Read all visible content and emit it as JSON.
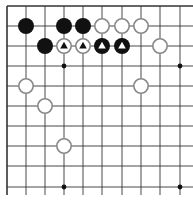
{
  "board": {
    "type": "go-diagram-corner",
    "grid": {
      "x_lines": [
        7,
        26,
        45,
        64,
        83,
        102,
        122,
        141,
        160,
        180
      ],
      "y_lines": [
        6,
        26,
        46,
        66,
        86,
        106,
        126,
        146,
        166,
        187
      ],
      "x_extent": [
        7,
        193
      ],
      "y_extent": [
        6,
        195
      ],
      "line_color": "#333333",
      "edge_top": true,
      "edge_left": true
    },
    "star_points": [
      {
        "col": 3,
        "row": 3
      },
      {
        "col": 9,
        "row": 3
      },
      {
        "col": 3,
        "row": 9
      },
      {
        "col": 9,
        "row": 9
      }
    ],
    "stones": [
      {
        "col": 1,
        "row": 1,
        "color": "black",
        "mark": ""
      },
      {
        "col": 3,
        "row": 1,
        "color": "black",
        "mark": ""
      },
      {
        "col": 4,
        "row": 1,
        "color": "black",
        "mark": ""
      },
      {
        "col": 5,
        "row": 1,
        "color": "white",
        "mark": ""
      },
      {
        "col": 6,
        "row": 1,
        "color": "white",
        "mark": ""
      },
      {
        "col": 7,
        "row": 1,
        "color": "white",
        "mark": ""
      },
      {
        "col": 2,
        "row": 2,
        "color": "black",
        "mark": ""
      },
      {
        "col": 3,
        "row": 2,
        "color": "white",
        "mark": "triangle"
      },
      {
        "col": 4,
        "row": 2,
        "color": "white",
        "mark": "triangle"
      },
      {
        "col": 5,
        "row": 2,
        "color": "black",
        "mark": "triangle"
      },
      {
        "col": 6,
        "row": 2,
        "color": "black",
        "mark": "triangle"
      },
      {
        "col": 8,
        "row": 2,
        "color": "white",
        "mark": ""
      },
      {
        "col": 1,
        "row": 4,
        "color": "white",
        "mark": ""
      },
      {
        "col": 7,
        "row": 4,
        "color": "white",
        "mark": ""
      },
      {
        "col": 2,
        "row": 5,
        "color": "white",
        "mark": ""
      },
      {
        "col": 3,
        "row": 7,
        "color": "white",
        "mark": ""
      }
    ],
    "colors": {
      "black_stone": "#111111",
      "white_stone_fill": "#ffffff",
      "white_stone_stroke": "#888888",
      "mark_on_white": "#111111",
      "mark_on_black": "#ffffff"
    }
  }
}
